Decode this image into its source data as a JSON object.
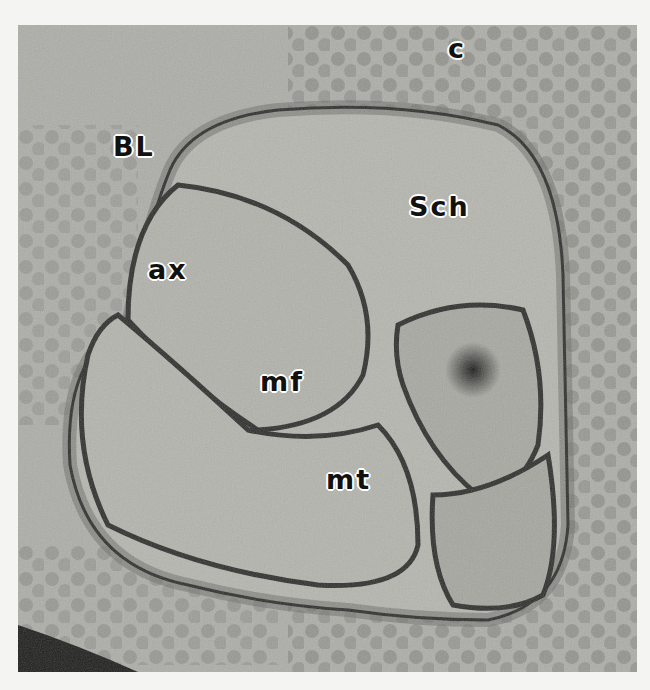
{
  "figure": {
    "type": "transmission electron micrograph",
    "labels": [
      {
        "id": "c",
        "text": "c",
        "x": 448,
        "y": 35
      },
      {
        "id": "BL",
        "text": "BL",
        "x": 113,
        "y": 133
      },
      {
        "id": "Sch",
        "text": "Sch",
        "x": 409,
        "y": 193
      },
      {
        "id": "ax",
        "text": "ax",
        "x": 148,
        "y": 256
      },
      {
        "id": "mf",
        "text": "mf",
        "x": 260,
        "y": 368
      },
      {
        "id": "mt",
        "text": "mt",
        "x": 326,
        "y": 466
      }
    ],
    "colors": {
      "background": "#f4f4f2",
      "cytoplasm": "#b4b4ae",
      "membrane": "#2e2e2c",
      "collagen": "#8a8a86"
    }
  }
}
